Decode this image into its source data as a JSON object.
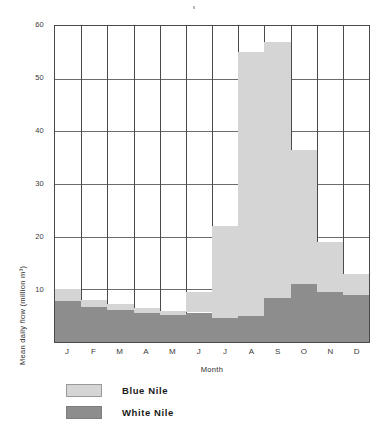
{
  "chart_data": {
    "type": "bar",
    "stacked": true,
    "title": "",
    "subtitle": "",
    "xlabel": "Month",
    "ylabel": "Mean daily flow (million m³)",
    "categories": [
      "J",
      "F",
      "M",
      "A",
      "M",
      "J",
      "J",
      "A",
      "S",
      "O",
      "N",
      "D"
    ],
    "category_names": [
      "January",
      "February",
      "March",
      "April",
      "May",
      "June",
      "July",
      "August",
      "September",
      "October",
      "November",
      "December"
    ],
    "series": [
      {
        "name": "White Nile",
        "color": "#8d8d8d",
        "values": [
          7.7,
          6.6,
          6.0,
          5.6,
          5.2,
          5.6,
          4.6,
          5.0,
          8.4,
          11.0,
          9.5,
          9.0
        ]
      },
      {
        "name": "Blue Nile",
        "color": "#d5d5d5",
        "values": [
          2.3,
          1.4,
          1.3,
          0.9,
          0.7,
          3.9,
          17.4,
          50.0,
          48.6,
          25.5,
          9.5,
          4.0
        ]
      }
    ],
    "totals": [
      10.0,
      8.0,
      7.3,
      6.5,
      5.9,
      9.5,
      22.0,
      55.0,
      57.0,
      36.5,
      19.0,
      13.0
    ],
    "ylim": [
      0,
      60
    ],
    "yticks": [
      10,
      20,
      30,
      40,
      50,
      60
    ],
    "ytick_labels": [
      "10",
      "20",
      "30",
      "40",
      "50",
      "60"
    ],
    "xlim_categories": 12,
    "grid": true,
    "grid_axis": "y",
    "legend_position": "below-left",
    "legend": [
      {
        "label": "Blue Nile",
        "color": "#d5d5d5"
      },
      {
        "label": "White Nile",
        "color": "#8d8d8d"
      }
    ]
  },
  "axes": {
    "y_axis_title": "Mean daily flow (million m³)",
    "x_axis_title": "Month"
  },
  "colors": {
    "blue_nile": "#d5d5d5",
    "white_nile": "#8d8d8d",
    "frame": "#4a4a4a",
    "gridline": "#6b6b6b",
    "background": "#ffffff"
  }
}
